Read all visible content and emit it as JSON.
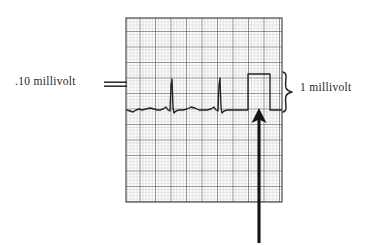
{
  "figure": {
    "background_color": "#ffffff",
    "ink_color": "#1f1f1f",
    "grid_color_fine": "#b9b9b9",
    "grid_color_bold": "#5a5a5a",
    "trace_color": "#2a2a2a"
  },
  "labels": {
    "left": ".10 millivolt",
    "right": "1 millivolt"
  },
  "annotations": {
    "left_pointer": "double-line-pointer",
    "right_brace": "curly-brace",
    "up_arrow": "upward-arrow-pointer"
  },
  "chart_data": {
    "type": "line",
    "xlabel": "",
    "ylabel": "",
    "grid": true,
    "legend": "none",
    "paper": {
      "x_start": 126,
      "x_end": 282,
      "y_start": 18,
      "y_end": 202,
      "fine_cell_px": 3.1,
      "bold_every": 5
    },
    "baseline_y": 110,
    "series": [
      {
        "name": "ecg-trace",
        "description": "two cardiac cycles on baseline followed by 1 mV rectangular calibration pulse",
        "points": [
          [
            127,
            110
          ],
          [
            130,
            111
          ],
          [
            133,
            112
          ],
          [
            136,
            110
          ],
          [
            139,
            109
          ],
          [
            142,
            110
          ],
          [
            146,
            109
          ],
          [
            150,
            108
          ],
          [
            154,
            109
          ],
          [
            157,
            110
          ],
          [
            160,
            110
          ],
          [
            163,
            109
          ],
          [
            166,
            107
          ],
          [
            168,
            110
          ],
          [
            170,
            111
          ],
          [
            171,
            85
          ],
          [
            172,
            79
          ],
          [
            173,
            108
          ],
          [
            174,
            113
          ],
          [
            176,
            111
          ],
          [
            179,
            110
          ],
          [
            183,
            110
          ],
          [
            187,
            109
          ],
          [
            191,
            107
          ],
          [
            195,
            108
          ],
          [
            199,
            110
          ],
          [
            203,
            110
          ],
          [
            207,
            110
          ],
          [
            211,
            109
          ],
          [
            214,
            107
          ],
          [
            216,
            110
          ],
          [
            218,
            111
          ],
          [
            219,
            85
          ],
          [
            220,
            78
          ],
          [
            221,
            107
          ],
          [
            222,
            113
          ],
          [
            224,
            111
          ],
          [
            227,
            110
          ],
          [
            231,
            110
          ],
          [
            235,
            110
          ],
          [
            240,
            110
          ],
          [
            244,
            110
          ],
          [
            248,
            110
          ],
          [
            248,
            74
          ],
          [
            270,
            74
          ],
          [
            270,
            110
          ],
          [
            276,
            110
          ],
          [
            282,
            110
          ]
        ]
      }
    ],
    "calibration_pulse": {
      "label": "1 millivolt",
      "x_left": 248,
      "x_right": 270,
      "top_y": 74,
      "baseline_y": 110,
      "amplitude_mv": 1
    },
    "minor_calibration": {
      "label": ".10 millivolt",
      "value_mv": 0.1,
      "pointer_y": 84
    },
    "qrs_peaks": [
      {
        "x": 172,
        "y": 79
      },
      {
        "x": 220,
        "y": 78
      }
    ]
  }
}
